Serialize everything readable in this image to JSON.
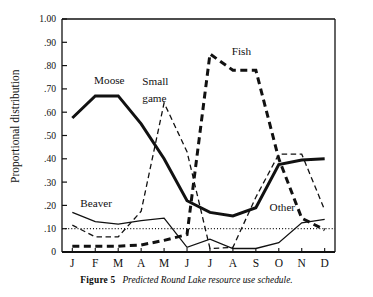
{
  "figure": {
    "caption_label": "Figure 5",
    "caption_text": "Predicted Round Lake resource use schedule."
  },
  "chart_data": {
    "type": "line",
    "title": "",
    "xlabel": "",
    "ylabel": "Proportional distribution",
    "categories": [
      "J",
      "F",
      "M",
      "A",
      "M",
      "J",
      "J",
      "A",
      "S",
      "O",
      "N",
      "D"
    ],
    "category_names": [
      "January",
      "February",
      "March",
      "April",
      "May",
      "June",
      "July",
      "August",
      "September",
      "October",
      "November",
      "December"
    ],
    "ylim": [
      0,
      1.0
    ],
    "yticks": [
      0,
      0.1,
      0.2,
      0.3,
      0.4,
      0.5,
      0.6,
      0.7,
      0.8,
      0.9,
      1.0
    ],
    "ytick_labels": [
      "0",
      ".10",
      ".20",
      ".30",
      ".40",
      ".50",
      ".60",
      ".70",
      ".80",
      ".90",
      "1.00"
    ],
    "grid": false,
    "legend": "inline-annotations",
    "reference_line": {
      "name": "ten-percent-reference",
      "value": 0.1,
      "style": "dotted"
    },
    "series": [
      {
        "name": "Moose",
        "style": "thick-solid",
        "color": "#111111",
        "values": [
          0.575,
          0.67,
          0.67,
          0.55,
          0.4,
          0.22,
          0.17,
          0.155,
          0.19,
          0.375,
          0.395,
          0.4
        ]
      },
      {
        "name": "Fish",
        "style": "thick-dashed",
        "color": "#111111",
        "values": [
          0.025,
          0.025,
          0.025,
          0.03,
          0.05,
          0.075,
          0.85,
          0.78,
          0.78,
          0.4,
          0.145,
          0.095
        ]
      },
      {
        "name": "Small game",
        "style": "thin-dashed",
        "color": "#111111",
        "values": [
          0.115,
          0.065,
          0.065,
          0.175,
          0.64,
          0.43,
          0.015,
          0.02,
          0.235,
          0.42,
          0.42,
          0.18
        ]
      },
      {
        "name": "Beaver",
        "style": "thin-solid",
        "color": "#111111",
        "values": [
          0.17,
          0.13,
          0.12,
          0.135,
          0.145,
          0.02,
          0.055,
          0.015,
          0.015,
          0.04,
          0.125,
          0.14
        ]
      },
      {
        "name": "Other",
        "style": "thin-solid-right",
        "color": "#111111",
        "values": [
          null,
          null,
          null,
          null,
          null,
          null,
          null,
          null,
          0.015,
          0.04,
          0.125,
          0.14
        ]
      }
    ],
    "annotations": [
      {
        "text": "Moose",
        "x": 0.95,
        "y": 0.72
      },
      {
        "text": "Small",
        "x": 3.05,
        "y": 0.715
      },
      {
        "text": "game",
        "x": 3.05,
        "y": 0.645
      },
      {
        "text": "Fish",
        "x": 6.95,
        "y": 0.845
      },
      {
        "text": "Beaver",
        "x": 0.35,
        "y": 0.195
      },
      {
        "text": "Other",
        "x": 8.6,
        "y": 0.175
      }
    ]
  }
}
